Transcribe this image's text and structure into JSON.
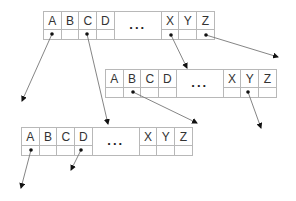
{
  "diagram": {
    "type": "b-tree-trie-nodes",
    "nodes": [
      {
        "id": "top",
        "x": 43,
        "y": 11,
        "keys_left": [
          "A",
          "B",
          "C",
          "D"
        ],
        "ellipsis": "...",
        "keys_right": [
          "X",
          "Y",
          "Z"
        ]
      },
      {
        "id": "middle",
        "x": 105,
        "y": 69,
        "keys_left": [
          "A",
          "B",
          "C",
          "D"
        ],
        "ellipsis": "...",
        "keys_right": [
          "X",
          "Y",
          "Z"
        ]
      },
      {
        "id": "bottom",
        "x": 21,
        "y": 127,
        "keys_left": [
          "A",
          "B",
          "C",
          "D"
        ],
        "ellipsis": "...",
        "keys_right": [
          "X",
          "Y",
          "Z"
        ]
      }
    ],
    "arrows": [
      {
        "from_node": "top",
        "from_key": "A",
        "x1": 52,
        "y1": 34,
        "x2": 22,
        "y2": 101
      },
      {
        "from_node": "top",
        "from_key": "C",
        "x1": 87,
        "y1": 34,
        "x2": 108,
        "y2": 124
      },
      {
        "from_node": "top",
        "from_key": "X",
        "x1": 171,
        "y1": 35,
        "x2": 187,
        "y2": 68
      },
      {
        "from_node": "top",
        "from_key": "Z",
        "x1": 206,
        "y1": 35,
        "x2": 278,
        "y2": 57
      },
      {
        "from_node": "middle",
        "from_key": "B",
        "x1": 133,
        "y1": 92,
        "x2": 197,
        "y2": 123
      },
      {
        "from_node": "middle",
        "from_key": "Y",
        "x1": 248,
        "y1": 92,
        "x2": 261,
        "y2": 128
      },
      {
        "from_node": "bottom",
        "from_key": "A",
        "x1": 31,
        "y1": 150,
        "x2": 21,
        "y2": 188
      },
      {
        "from_node": "bottom",
        "from_key": "D",
        "x1": 81,
        "y1": 150,
        "x2": 71,
        "y2": 170
      }
    ],
    "colors": {
      "line": "#777777",
      "border": "#b8b8b8",
      "dot": "#111111",
      "text": "#333333"
    }
  }
}
